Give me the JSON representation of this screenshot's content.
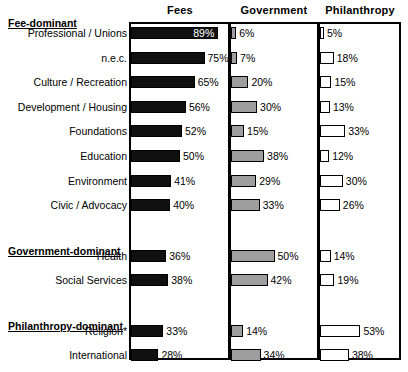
{
  "chart_data": {
    "type": "bar",
    "title": "",
    "subtitle": "",
    "xlabel": "",
    "ylabel": "",
    "grid": false,
    "legend_position": "none",
    "orientation": "horizontal",
    "units": "percent",
    "axis_max": 100,
    "panels": [
      {
        "key": "fees",
        "label": "Fees"
      },
      {
        "key": "government",
        "label": "Government"
      },
      {
        "key": "philanthropy",
        "label": "Philanthropy"
      }
    ],
    "sections": [
      {
        "heading": "Fee-dominant",
        "rows": [
          {
            "label": "Professional / Unions",
            "fees": 89,
            "government": 6,
            "philanthropy": 5,
            "fees_text": "89%",
            "government_text": "6%",
            "philanthropy_text": "5%",
            "fees_label_inside": true
          },
          {
            "label": "n.e.c.",
            "fees": 75,
            "government": 7,
            "philanthropy": 18,
            "fees_text": "75%",
            "government_text": "7%",
            "philanthropy_text": "18%",
            "fees_label_inside": false
          },
          {
            "label": "Culture / Recreation",
            "fees": 65,
            "government": 20,
            "philanthropy": 15,
            "fees_text": "65%",
            "government_text": "20%",
            "philanthropy_text": "15%",
            "fees_label_inside": false
          },
          {
            "label": "Development / Housing",
            "fees": 56,
            "government": 30,
            "philanthropy": 13,
            "fees_text": "56%",
            "government_text": "30%",
            "philanthropy_text": "13%",
            "fees_label_inside": false
          },
          {
            "label": "Foundations",
            "fees": 52,
            "government": 15,
            "philanthropy": 33,
            "fees_text": "52%",
            "government_text": "15%",
            "philanthropy_text": "33%",
            "fees_label_inside": false
          },
          {
            "label": "Education",
            "fees": 50,
            "government": 38,
            "philanthropy": 12,
            "fees_text": "50%",
            "government_text": "38%",
            "philanthropy_text": "12%",
            "fees_label_inside": false
          },
          {
            "label": "Environment",
            "fees": 41,
            "government": 29,
            "philanthropy": 30,
            "fees_text": "41%",
            "government_text": "29%",
            "philanthropy_text": "30%",
            "fees_label_inside": false
          },
          {
            "label": "Civic / Advocacy",
            "fees": 40,
            "government": 33,
            "philanthropy": 26,
            "fees_text": "40%",
            "government_text": "33%",
            "philanthropy_text": "26%",
            "fees_label_inside": false
          }
        ]
      },
      {
        "heading": "Government-dominant",
        "rows": [
          {
            "label": "Health",
            "fees": 36,
            "government": 50,
            "philanthropy": 14,
            "fees_text": "36%",
            "government_text": "50%",
            "philanthropy_text": "14%",
            "fees_label_inside": false
          },
          {
            "label": "Social Services",
            "fees": 38,
            "government": 42,
            "philanthropy": 19,
            "fees_text": "38%",
            "government_text": "42%",
            "philanthropy_text": "19%",
            "fees_label_inside": false
          }
        ]
      },
      {
        "heading": "Philanthropy-dominant",
        "rows": [
          {
            "label": "Religion*",
            "fees": 33,
            "government": 14,
            "philanthropy": 53,
            "fees_text": "33%",
            "government_text": "14%",
            "philanthropy_text": "53%",
            "fees_label_inside": false
          },
          {
            "label": "International",
            "fees": 28,
            "government": 34,
            "philanthropy": 38,
            "fees_text": "28%",
            "government_text": "34%",
            "philanthropy_text": "38%",
            "fees_label_inside": false
          }
        ]
      }
    ],
    "colors": {
      "fees_bar": "#101010",
      "government_bar": "#9e9e9e",
      "philanthropy_bar": "#ffffff",
      "outline": "#000000",
      "text": "#000000",
      "inside_label_text": "#ffffff",
      "background": "#ffffff"
    }
  }
}
